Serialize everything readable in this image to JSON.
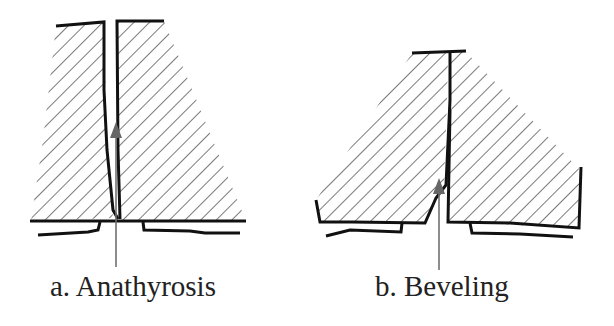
{
  "figure": {
    "panels": [
      {
        "id": "a",
        "caption": "a. Anathyrosis",
        "description": "Two hatched stone blocks with a narrow vertical joint; arrow points up into the joint"
      },
      {
        "id": "b",
        "caption": "b. Beveling",
        "description": "Two hatched stone blocks with beveled lower corner at the joint; arrow points up into the bevel"
      }
    ],
    "colors": {
      "line": "#111111",
      "arrow": "#707070",
      "hatch": "#333333",
      "background": "#ffffff"
    }
  }
}
